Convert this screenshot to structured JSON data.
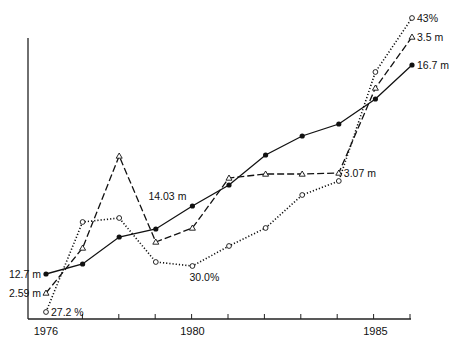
{
  "chart_data": {
    "type": "line",
    "title": "",
    "xlabel": "",
    "ylabel": "",
    "x": [
      1976,
      1977,
      1978,
      1979,
      1980,
      1981,
      1982,
      1983,
      1984,
      1985,
      1986
    ],
    "x_tick_labels": [
      {
        "year": 1976,
        "label": "1976"
      },
      {
        "year": 1980,
        "label": "1980"
      },
      {
        "year": 1985,
        "label": "1985"
      }
    ],
    "grid": false,
    "legend": "none (series identified by inline labels)",
    "series": [
      {
        "name": "solid-filled-circles",
        "style": "solid",
        "marker": "filled-circle",
        "unit": "m",
        "pixel_y": [
          274,
          264,
          237,
          229,
          206,
          185,
          155,
          136,
          124,
          99,
          65
        ],
        "annotations": [
          {
            "year": 1976,
            "label": "12.7 m",
            "side": "left"
          },
          {
            "year": 1980,
            "label": "14.03 m",
            "side": "left-above"
          },
          {
            "year": 1986,
            "label": "16.7 m",
            "side": "right"
          }
        ]
      },
      {
        "name": "dashed-triangles",
        "style": "dashed",
        "marker": "open-triangle",
        "unit": "m",
        "pixel_y": [
          293,
          248,
          156,
          242,
          228,
          178,
          174,
          174,
          173,
          88,
          37
        ],
        "annotations": [
          {
            "year": 1976,
            "label": "2.59 m",
            "side": "left"
          },
          {
            "year": 1984,
            "label": "3.07 m",
            "side": "right"
          },
          {
            "year": 1986,
            "label": "3.5 m",
            "side": "right"
          }
        ]
      },
      {
        "name": "dotted-open-circles",
        "style": "dotted",
        "marker": "open-circle",
        "unit": "%",
        "pixel_y": [
          312,
          222,
          218,
          262,
          266,
          246,
          228,
          195,
          181,
          72,
          18
        ],
        "annotations": [
          {
            "year": 1976,
            "label": "27.2 %",
            "side": "right"
          },
          {
            "year": 1980,
            "label": "30.0%",
            "side": "below"
          },
          {
            "year": 1986,
            "label": "43%",
            "side": "right"
          }
        ]
      }
    ]
  }
}
